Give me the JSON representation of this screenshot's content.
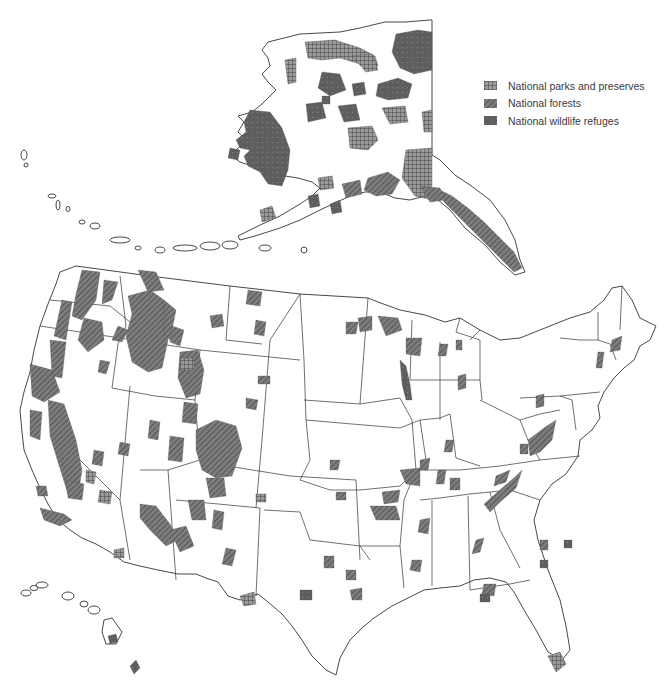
{
  "map": {
    "title": "Federal lands: national parks, forests, and wildlife refuges",
    "regions": [
      "Alaska",
      "Contiguous United States",
      "Hawaii"
    ]
  },
  "legend": {
    "items": [
      {
        "key": "park",
        "label": "National parks and preserves",
        "pattern": "crosshatch-grid",
        "color": "#888888"
      },
      {
        "key": "forest",
        "label": "National forests",
        "pattern": "diagonal-hatch",
        "color": "#7a7a7a"
      },
      {
        "key": "refuge",
        "label": "National wildlife refuges",
        "pattern": "dotted-dark",
        "color": "#5e5e5e"
      }
    ]
  },
  "colors": {
    "background": "#ffffff",
    "outline": "#333333",
    "fill_dark": "#5e5e5e",
    "fill_mid": "#888888"
  }
}
